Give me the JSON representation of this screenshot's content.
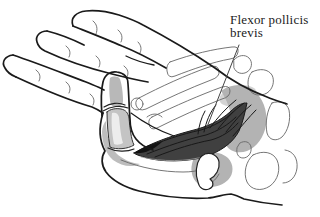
{
  "figure": {
    "label": {
      "line1": "Flexor pollicis",
      "line2": "brevis"
    }
  },
  "colors": {
    "background": "#ffffff",
    "outline": "#1a1a1a",
    "detail_line": "#666666",
    "bone_shading": "#b8b8b8",
    "light_shading": "#d4d4d4",
    "thenar_shading": "#b3b3b3",
    "muscle_fill": "#404040",
    "muscle_tip": "#121212",
    "muscle_striation": "#181818",
    "label_text": "#1b1b1b",
    "leader_line": "#444444"
  }
}
